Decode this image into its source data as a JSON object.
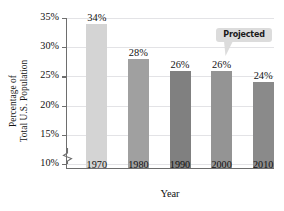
{
  "chart_data": {
    "type": "bar",
    "title": "",
    "categories": [
      "1970",
      "1980",
      "1990",
      "2000",
      "2010"
    ],
    "values": [
      34,
      28,
      26,
      26,
      24
    ],
    "value_labels": [
      "34%",
      "28%",
      "26%",
      "26%",
      "24%"
    ],
    "bar_colors": [
      "#d4d4d4",
      "#a0a0a0",
      "#808080",
      "#949494",
      "#8a8a8a"
    ],
    "xlabel": "Year",
    "ylabel_line1": "Percentage of",
    "ylabel_line2": "Total U.S. Population",
    "ylim": [
      10,
      35
    ],
    "ytick_labels": [
      "35%",
      "30%",
      "25%",
      "20%",
      "15%",
      "10%"
    ],
    "ytick_values": [
      35,
      30,
      25,
      20,
      15,
      10
    ],
    "grid": true,
    "grid_color": "#e3e3e6",
    "axis_color": "#6e6e6e",
    "axis_break": true,
    "legend": "none",
    "annotations": [
      {
        "name": "projected-callout",
        "text": "Projected",
        "points_to_category": "2010",
        "bubble_color": "#dcdcdc"
      }
    ]
  }
}
